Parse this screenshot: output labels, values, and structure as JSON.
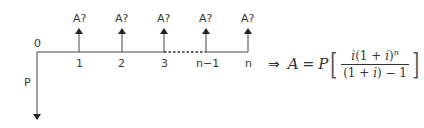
{
  "diagram": {
    "type": "cash-flow-timeline",
    "origin_label": "0",
    "present_value_label": "P",
    "payment_label": "A?",
    "periods": [
      {
        "label": "1",
        "x": 79
      },
      {
        "label": "2",
        "x": 122
      },
      {
        "label": "3",
        "x": 164
      },
      {
        "label": "n−1",
        "x": 206
      },
      {
        "label": "n",
        "x": 248
      }
    ],
    "dashed_segment": {
      "from": "3",
      "to": "n−1"
    },
    "colors": {
      "line": "#333333",
      "text": "#3a3a3a"
    }
  },
  "formula": {
    "implies": "⇒",
    "lhs": "A",
    "equals": "=",
    "factor": "P",
    "numerator": {
      "i": "i",
      "open": "(1 + ",
      "i2": "i",
      "close": ")",
      "exp": "n"
    },
    "denominator": {
      "open": "(1 + ",
      "i": "i",
      "close": ") − 1"
    },
    "left_bracket": "[",
    "right_bracket": "]"
  }
}
